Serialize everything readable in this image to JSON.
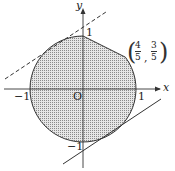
{
  "figure": {
    "axes": {
      "x_label": "x",
      "y_label": "y",
      "origin_label": "O",
      "ticks": {
        "x_neg": "−1",
        "x_pos": "1",
        "y_pos": "1",
        "y_neg": "−1"
      }
    },
    "point_label": {
      "x_num": "4",
      "x_den": "5",
      "y_num": "3",
      "y_den": "5",
      "comma": ","
    },
    "colors": {
      "stroke": "#333333",
      "shade": "#bdbdbd",
      "background": "#ffffff"
    },
    "elements": [
      "unit circle region (shaded)",
      "segment from (0,1) to (4/5,3/5)",
      "dashed tangent line upper-left",
      "solid tangent line lower-right"
    ]
  }
}
